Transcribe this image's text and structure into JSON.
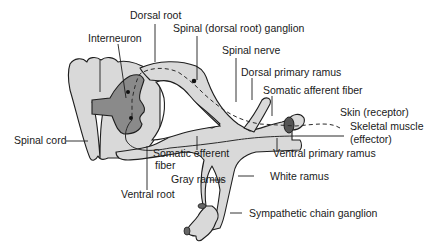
{
  "diagram": {
    "labels": {
      "dorsal_root": "Dorsal root",
      "spinal_ganglion": "Spinal (dorsal root) ganglion",
      "interneuron": "Interneuron",
      "spinal_nerve": "Spinal nerve",
      "dorsal_primary_ramus": "Dorsal primary ramus",
      "somatic_afferent_fiber": "Somatic afferent fiber",
      "skin_receptor": "Skin (receptor)",
      "skeletal_muscle_line1": "Skeletal muscle",
      "skeletal_muscle_line2": "(effector)",
      "spinal_cord": "Spinal cord",
      "somatic_efferent_line1": "Somatic efferent",
      "somatic_efferent_line2": "fiber",
      "ventral_primary_ramus": "Ventral primary ramus",
      "gray_ramus": "Gray ramus",
      "white_ramus": "White ramus",
      "ventral_root": "Ventral root",
      "sympathetic_chain_ganglion": "Sympathetic chain ganglion"
    },
    "colors": {
      "tissue": "#d9d9d9",
      "gray_matter": "#8a8a8a",
      "outline": "#1e1e1e"
    }
  }
}
